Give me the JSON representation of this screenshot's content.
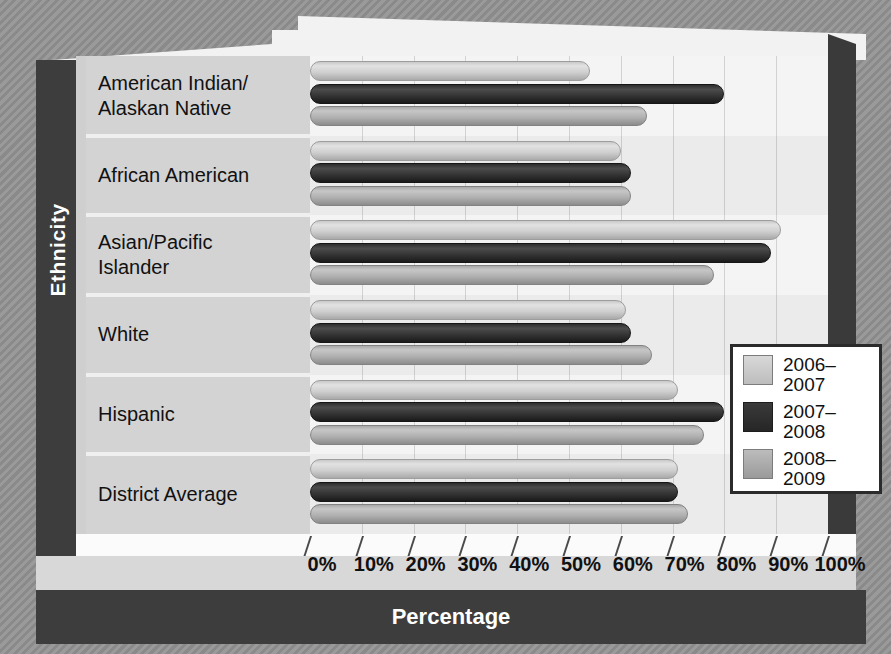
{
  "chart_data": {
    "type": "bar",
    "orientation": "horizontal",
    "title": "",
    "xlabel": "Percentage",
    "ylabel": "Ethnicity",
    "xlim": [
      0,
      100
    ],
    "grid": true,
    "legend_position": "inside-right",
    "tick_labels": [
      "0%",
      "10%",
      "20%",
      "30%",
      "40%",
      "50%",
      "60%",
      "70%",
      "80%",
      "90%",
      "100%"
    ],
    "categories": [
      "American Indian/\nAlaskan Native",
      "African American",
      "Asian/Pacific\nIslander",
      "White",
      "Hispanic",
      "District Average"
    ],
    "series": [
      {
        "name": "2006–2007",
        "color": "#cfcfcf",
        "values": [
          54,
          60,
          91,
          61,
          71,
          71
        ]
      },
      {
        "name": "2007–2008",
        "color": "#2b2b2b",
        "values": [
          80,
          62,
          89,
          62,
          80,
          71
        ]
      },
      {
        "name": "2008–2009",
        "color": "#a9a9a9",
        "values": [
          65,
          62,
          78,
          66,
          76,
          73
        ]
      }
    ]
  },
  "categories": [
    {
      "line1": "American Indian/",
      "line2": "Alaskan Native"
    },
    {
      "line1": "African American",
      "line2": ""
    },
    {
      "line1": "Asian/Pacific",
      "line2": "Islander"
    },
    {
      "line1": "White",
      "line2": ""
    },
    {
      "line1": "Hispanic",
      "line2": ""
    },
    {
      "line1": "District Average",
      "line2": ""
    }
  ],
  "legend": {
    "items": [
      {
        "label": "2006–",
        "label2": "2007"
      },
      {
        "label": "2007–",
        "label2": "2008"
      },
      {
        "label": "2008–",
        "label2": "2009"
      }
    ]
  },
  "axes": {
    "y_title": "Ethnicity",
    "x_title": "Percentage",
    "x_ticks": [
      "0%",
      "10%",
      "20%",
      "30%",
      "40%",
      "50%",
      "60%",
      "70%",
      "80%",
      "90%",
      "100%"
    ]
  }
}
